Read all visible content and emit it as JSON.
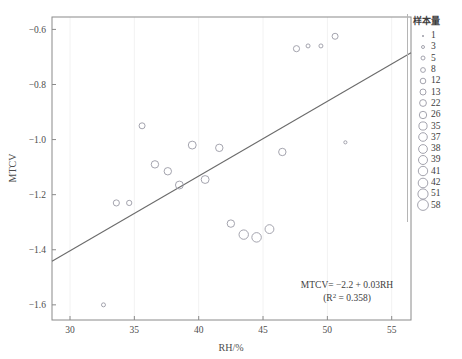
{
  "chart_data": {
    "type": "scatter",
    "title": "",
    "xlabel": "RH/%",
    "ylabel": "MTCV",
    "xlim": [
      28.6,
      56.5
    ],
    "ylim": [
      -1.655,
      -0.555
    ],
    "xticks": [
      30,
      35,
      40,
      45,
      50,
      55
    ],
    "yticks": [
      -0.6,
      -0.8,
      -1.0,
      -1.2,
      -1.4,
      -1.6
    ],
    "grid": false,
    "legend_position": "right",
    "points": [
      {
        "x": 32.6,
        "y": -1.6,
        "n": 3
      },
      {
        "x": 33.6,
        "y": -1.23,
        "n": 13
      },
      {
        "x": 34.6,
        "y": -1.23,
        "n": 8
      },
      {
        "x": 35.6,
        "y": -0.95,
        "n": 12
      },
      {
        "x": 36.6,
        "y": -1.09,
        "n": 22
      },
      {
        "x": 37.6,
        "y": -1.115,
        "n": 22
      },
      {
        "x": 38.5,
        "y": -1.165,
        "n": 26
      },
      {
        "x": 39.5,
        "y": -1.02,
        "n": 26
      },
      {
        "x": 40.5,
        "y": -1.145,
        "n": 26
      },
      {
        "x": 41.6,
        "y": -1.03,
        "n": 22
      },
      {
        "x": 42.5,
        "y": -1.305,
        "n": 22
      },
      {
        "x": 43.5,
        "y": -1.345,
        "n": 41
      },
      {
        "x": 44.5,
        "y": -1.355,
        "n": 42
      },
      {
        "x": 45.5,
        "y": -1.325,
        "n": 35
      },
      {
        "x": 46.5,
        "y": -1.045,
        "n": 22
      },
      {
        "x": 47.6,
        "y": -0.67,
        "n": 13
      },
      {
        "x": 48.5,
        "y": -0.66,
        "n": 3
      },
      {
        "x": 49.5,
        "y": -0.66,
        "n": 3
      },
      {
        "x": 50.6,
        "y": -0.625,
        "n": 12
      },
      {
        "x": 51.4,
        "y": -1.01,
        "n": 1
      }
    ],
    "regression": {
      "equation": "MTCV= −2.2 + 0.03RH",
      "r_squared_text": "(R² = 0.358)",
      "r_squared": 0.358,
      "intercept": -2.2,
      "slope": 0.03,
      "line_x": [
        28.6,
        56.5
      ],
      "line_y": [
        -1.442,
        -0.685
      ]
    }
  },
  "annotation": {
    "equation": "MTCV= −2.2 + 0.03RH",
    "r_squared": "(R",
    "r_squared_sup": "2",
    "r_squared_rest": " = 0.358)"
  },
  "axes": {
    "x_title": "RH/%",
    "y_title": "MTCV",
    "x_tick_labels": [
      "30",
      "35",
      "40",
      "45",
      "50",
      "55"
    ],
    "y_tick_labels": [
      "−0.6",
      "−0.8",
      "−1.0",
      "−1.2",
      "−1.4",
      "−1.6"
    ]
  },
  "legend": {
    "title": "样本量",
    "items": [
      {
        "label": "1",
        "size": 1.0
      },
      {
        "label": "3",
        "size": 1.5
      },
      {
        "label": "5",
        "size": 2.0
      },
      {
        "label": "8",
        "size": 2.4
      },
      {
        "label": "12",
        "size": 2.8
      },
      {
        "label": "13",
        "size": 3.0
      },
      {
        "label": "22",
        "size": 3.4
      },
      {
        "label": "26",
        "size": 3.7
      },
      {
        "label": "35",
        "size": 4.1
      },
      {
        "label": "37",
        "size": 4.3
      },
      {
        "label": "38",
        "size": 4.4
      },
      {
        "label": "39",
        "size": 4.5
      },
      {
        "label": "41",
        "size": 4.7
      },
      {
        "label": "42",
        "size": 4.8
      },
      {
        "label": "51",
        "size": 5.1
      },
      {
        "label": "58",
        "size": 5.4
      }
    ]
  },
  "colors": {
    "point_stroke": "#9a9aa5",
    "regression_line": "#6b6b6b",
    "axis": "#8a8a8a",
    "text": "#3d3d3d"
  }
}
